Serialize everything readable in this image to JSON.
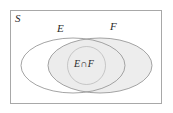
{
  "diagram": {
    "type": "venn-diagram",
    "universal_set": {
      "label": "S",
      "shape": "rectangle",
      "fill": "#ffffff",
      "stroke": "#a8a8a8"
    },
    "sets": [
      {
        "id": "E",
        "label": "E",
        "shape": "ellipse",
        "fill": "#ffffff",
        "stroke": "#9a9a9a"
      },
      {
        "id": "F",
        "label": "F",
        "shape": "ellipse",
        "fill": "#ededed",
        "stroke": "#9a9a9a"
      }
    ],
    "regions": [
      {
        "id": "E-intersect-F",
        "label": "E∩F",
        "fill": "#ececec",
        "stroke": "#9a9a9a"
      }
    ],
    "colors": {
      "background": "#ffffff",
      "frame_stroke": "#a8a8a8",
      "ellipse_stroke": "#9a9a9a",
      "shaded_fill": "#ededed",
      "intersection_fill": "#ececec",
      "text": "#2b2b2b"
    }
  }
}
